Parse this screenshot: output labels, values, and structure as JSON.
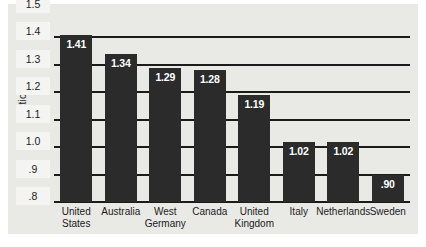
{
  "chart_data": {
    "type": "bar",
    "title": "",
    "subtitle": "",
    "xlabel": "",
    "ylabel": "Ratio",
    "ylim": [
      0.8,
      1.5
    ],
    "grid": true,
    "legend": false,
    "legend_position": "none",
    "orientation": "vertical",
    "bar_color": "#2b2b2b",
    "background_color": "#e9e9e6",
    "value_label_color": "#ffffff",
    "axis_color": "#1b1b1b",
    "categories": [
      "United States",
      "Australia",
      "West Germany",
      "Canada",
      "United Kingdom",
      "Italy",
      "Netherlands",
      "Sweden"
    ],
    "values": [
      1.41,
      1.34,
      1.29,
      1.28,
      1.19,
      1.02,
      1.02,
      0.9
    ],
    "value_labels": [
      "1.41",
      "1.34",
      "1.29",
      "1.28",
      "1.19",
      "1.02",
      "1.02",
      ".90"
    ],
    "y_ticks": [
      1.5,
      1.4,
      1.3,
      1.2,
      1.1,
      1.0,
      0.9,
      0.8
    ],
    "y_tick_labels": [
      "1.5",
      "1.4",
      "1.3",
      "1.2",
      "1.1",
      "1.0",
      ".9",
      ".8"
    ],
    "category_label_lines": [
      [
        "United",
        "States"
      ],
      [
        "Australia",
        ""
      ],
      [
        "West",
        "Germany"
      ],
      [
        "Canada",
        ""
      ],
      [
        "United",
        "Kingdom"
      ],
      [
        "Italy",
        ""
      ],
      [
        "Netherlands",
        ""
      ],
      [
        "Sweden",
        ""
      ]
    ]
  }
}
